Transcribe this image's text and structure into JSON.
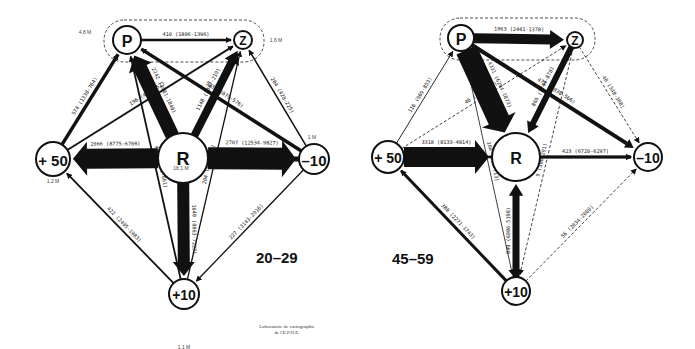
{
  "panels": [
    {
      "id": "left",
      "title": "20–29",
      "group_label": "P–Z group",
      "nodes": [
        {
          "id": "P",
          "label": "P",
          "pop": "4,8 M",
          "x": 127,
          "y": 40,
          "r": 14,
          "fs": 16
        },
        {
          "id": "Z",
          "label": "Z",
          "pop": "1,6 M",
          "x": 243,
          "y": 40,
          "r": 9,
          "fs": 12
        },
        {
          "id": "R",
          "label": "R",
          "pop": "18,1 M",
          "x": 183,
          "y": 158,
          "r": 25,
          "fs": 18
        },
        {
          "id": "+50",
          "label": "+ 50",
          "pop": "1,2 M",
          "x": 53,
          "y": 159,
          "r": 17,
          "fs": 15
        },
        {
          "id": "-10",
          "label": "–10",
          "pop": "1 M",
          "x": 314,
          "y": 159,
          "r": 15,
          "fs": 15
        },
        {
          "id": "+10",
          "label": "+10",
          "pop": "1,1 M",
          "x": 184,
          "y": 294,
          "r": 15,
          "fs": 14
        }
      ],
      "flows": [
        {
          "from": "P",
          "to": "Z",
          "label": "410 (1806-1396)",
          "w": 2.5
        },
        {
          "from": "R",
          "to": "P",
          "label": "2242 (4081-1840)",
          "w": 14
        },
        {
          "from": "R",
          "to": "Z",
          "label": "1148 (1367-219)",
          "w": 8
        },
        {
          "from": "R",
          "to": "+50",
          "label": "2066 (8775-6708)",
          "w": 20
        },
        {
          "from": "R",
          "to": "-10",
          "label": "2707 (12534-9827)",
          "w": 22
        },
        {
          "from": "R",
          "to": "+10",
          "label": "1640 (8863-7223)",
          "w": 12
        },
        {
          "from": "+50",
          "to": "P",
          "label": "574 (1338-764)",
          "w": 3.5
        },
        {
          "from": "+50",
          "to": "Z",
          "label": "196 (448-252)",
          "w": 1.8
        },
        {
          "from": "-10",
          "to": "P",
          "label": "503 (1079-576)",
          "w": 3.5
        },
        {
          "from": "-10",
          "to": "Z",
          "label": "204 (428-225)",
          "w": 1.5
        },
        {
          "from": "-10",
          "to": "+50",
          "label": "554 (3402-2848)",
          "w": 5
        },
        {
          "from": "-10",
          "to": "+10",
          "label": "227 (3143-2916)",
          "w": 1.3
        },
        {
          "from": "+10",
          "to": "+50",
          "label": "422 (2405-1983)",
          "w": 1.8
        },
        {
          "from": "+10",
          "to": "P",
          "label": "441 (1102-661)",
          "w": 1.8
        },
        {
          "from": "+10",
          "to": "Z",
          "label": "204 (416-212)",
          "w": 1.3
        }
      ],
      "credit_line1": "Laboratoire de cartographie",
      "credit_line2": "de l'E.P.H.E."
    },
    {
      "id": "right",
      "title": "45–59",
      "nodes": [
        {
          "id": "P",
          "label": "P",
          "pop": "",
          "x": 461,
          "y": 38,
          "r": 13,
          "fs": 16
        },
        {
          "id": "Z",
          "label": "Z",
          "pop": "",
          "x": 575,
          "y": 40,
          "r": 8,
          "fs": 12
        },
        {
          "id": "R",
          "label": "R",
          "pop": "",
          "x": 516,
          "y": 157,
          "r": 24,
          "fs": 16
        },
        {
          "id": "+50",
          "label": "+ 50",
          "pop": "",
          "x": 388,
          "y": 157,
          "r": 16,
          "fs": 14
        },
        {
          "id": "-10",
          "label": "–10",
          "pop": "",
          "x": 648,
          "y": 157,
          "r": 14,
          "fs": 14
        },
        {
          "id": "+10",
          "label": "+10",
          "pop": "",
          "x": 516,
          "y": 291,
          "r": 14,
          "fs": 14
        }
      ],
      "flows": [
        {
          "from": "P",
          "to": "Z",
          "label": "1063 (2441-1378)",
          "w": 10
        },
        {
          "from": "P",
          "to": "R",
          "label": "4331 (6204-1873)",
          "w": 22
        },
        {
          "from": "P",
          "to": "-10",
          "label": "472 (1038-566)",
          "w": 4
        },
        {
          "from": "Z",
          "to": "R",
          "label": "866 (1744-878)",
          "w": 6
        },
        {
          "from": "Z",
          "to": "-10",
          "label": "40 (348-308)",
          "w": 0.8,
          "dashed": true
        },
        {
          "from": "Z",
          "to": "+10",
          "label": "9 (300-291)",
          "w": 0.8,
          "dashed": true
        },
        {
          "from": "+50",
          "to": "P",
          "label": "116 (969-853)",
          "w": 0.9
        },
        {
          "from": "+50",
          "to": "Z",
          "label": "46 (310-264)",
          "w": 0.8,
          "dashed": true
        },
        {
          "from": "+50",
          "to": "R",
          "label": "3318 (8133-4814)",
          "w": 20
        },
        {
          "from": "+50",
          "to": "-10",
          "label": "336 (2473-2137)",
          "w": 2.5
        },
        {
          "from": "R",
          "to": "-10",
          "label": "423 (6720-6297)",
          "w": 3
        },
        {
          "from": "P",
          "to": "+10",
          "label": "100 (813-713)",
          "w": 0.8
        },
        {
          "from": "+10",
          "to": "+50",
          "label": "388 (2271-1743)",
          "w": 3
        },
        {
          "from": "+10",
          "to": "R",
          "label": "849 (6086-5198)",
          "w": 7
        },
        {
          "from": "+10",
          "to": "-10",
          "label": "56 (2034-2000)",
          "w": 0.8,
          "dashed": true
        }
      ]
    }
  ],
  "labels": {
    "left_title": "20–29",
    "right_title": "45–59",
    "left_pop_p": "4,8 M",
    "left_pop_z": "1,6 M",
    "left_pop_r": "18,1 M",
    "left_pop_plus50": "1,2 M",
    "left_pop_minus10": "1 M",
    "left_pop_plus10": "1,1 M",
    "credit_line1": "Laboratoire de cartographie",
    "credit_line2": "de l'E.P.H.E."
  },
  "colors": {
    "ink": "#111111",
    "background": "#ffffff"
  }
}
